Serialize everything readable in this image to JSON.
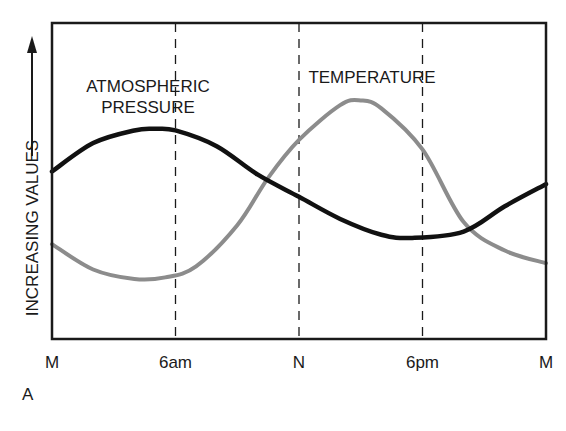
{
  "chart_data": {
    "type": "line",
    "title": "",
    "panel_label": "A",
    "xlabel": "",
    "ylabel": "INCREASING VALUES",
    "ylabel_arrow": "up",
    "x_ticks": [
      "M",
      "6am",
      "N",
      "6pm",
      "M"
    ],
    "x_hours": [
      0,
      6,
      12,
      18,
      24
    ],
    "grid": {
      "vertical_dashed_at_hours": [
        6,
        12,
        18
      ]
    },
    "ylim": [
      0,
      100
    ],
    "y_ticks_shown": false,
    "series": [
      {
        "name": "ATMOSPHERIC PRESSURE",
        "label_lines": [
          "ATMOSPHERIC",
          "PRESSURE"
        ],
        "color": "#111111",
        "x": [
          0,
          2,
          4,
          5,
          6,
          8,
          10,
          12,
          14,
          16,
          17.5,
          20,
          22,
          24
        ],
        "values": [
          53,
          62,
          66,
          66.5,
          66,
          61,
          52,
          45,
          38,
          33,
          32,
          34,
          42,
          49
        ]
      },
      {
        "name": "TEMPERATURE",
        "label_lines": [
          "TEMPERATURE"
        ],
        "color": "#8c8c8c",
        "x": [
          0,
          2,
          4,
          5.5,
          7,
          9,
          10.5,
          12,
          14,
          15,
          16,
          18,
          20,
          22,
          24
        ],
        "values": [
          30,
          22,
          19,
          19.5,
          23,
          36,
          51,
          63,
          74,
          75.5,
          73,
          60,
          37,
          28,
          24
        ]
      }
    ]
  }
}
